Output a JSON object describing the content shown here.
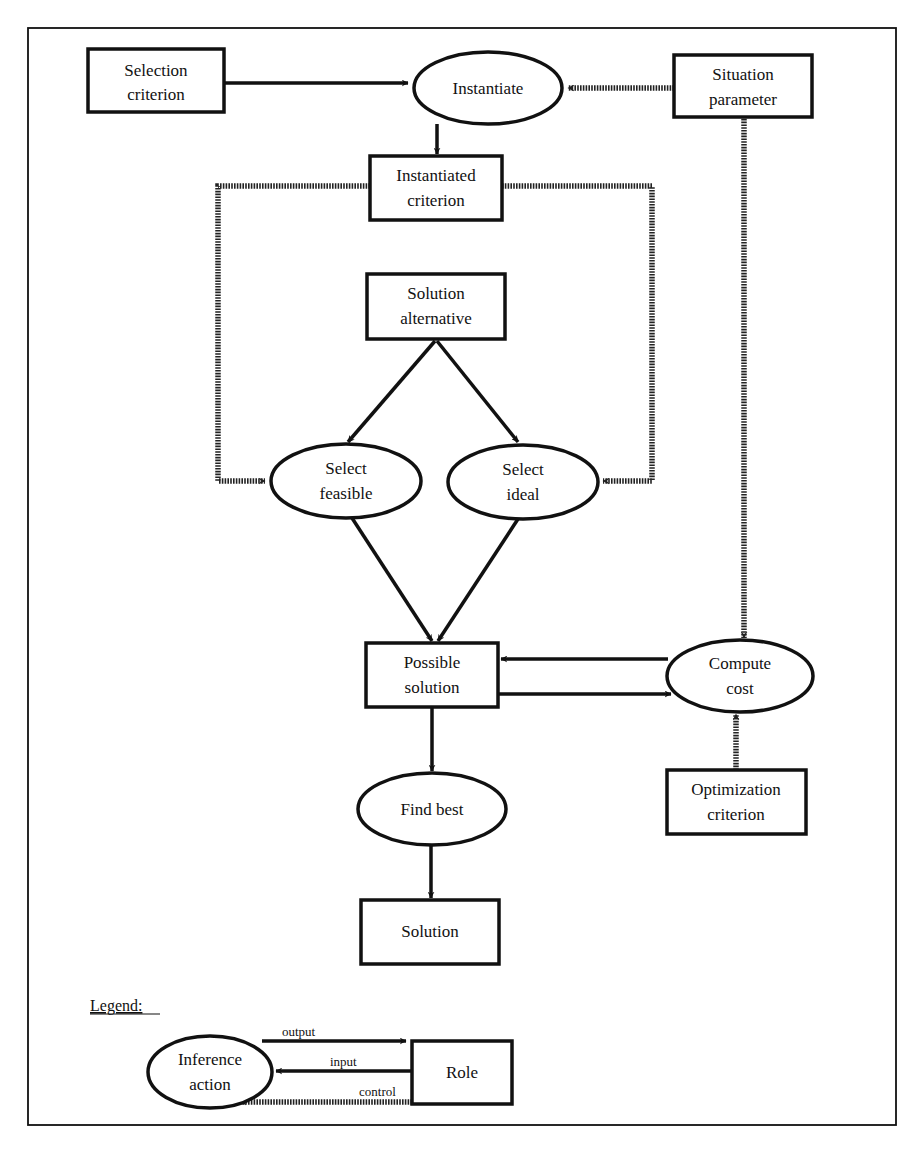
{
  "diagram": {
    "type": "inference-structure",
    "roles": {
      "selection_criterion": "Selection criterion",
      "situation_parameter": "Situation parameter",
      "instantiated_criterion": "Instantiated criterion",
      "solution_alternative": "Solution alternative",
      "possible_solution": "Possible solution",
      "optimization_criterion": "Optimization criterion",
      "solution": "Solution"
    },
    "role_lines": {
      "selection_criterion": [
        "Selection",
        "criterion"
      ],
      "situation_parameter": [
        "Situation",
        "parameter"
      ],
      "instantiated_criterion": [
        "Instantiated",
        "criterion"
      ],
      "solution_alternative": [
        "Solution",
        "alternative"
      ],
      "possible_solution": [
        "Possible",
        "solution"
      ],
      "optimization_criterion": [
        "Optimization",
        "criterion"
      ],
      "solution": [
        "Solution"
      ]
    },
    "inference_actions": {
      "instantiate": [
        "Instantiate"
      ],
      "select_feasible": [
        "Select",
        "feasible"
      ],
      "select_ideal": [
        "Select",
        "ideal"
      ],
      "compute_cost": [
        "Compute",
        "cost"
      ],
      "find_best": [
        "Find best"
      ]
    },
    "edges": [
      {
        "from": "Selection criterion",
        "to": "Instantiate",
        "kind": "input"
      },
      {
        "from": "Situation parameter",
        "to": "Instantiate",
        "kind": "control"
      },
      {
        "from": "Instantiate",
        "to": "Instantiated criterion",
        "kind": "output"
      },
      {
        "from": "Instantiated criterion",
        "to": "Select feasible",
        "kind": "control"
      },
      {
        "from": "Instantiated criterion",
        "to": "Select ideal",
        "kind": "control"
      },
      {
        "from": "Solution alternative",
        "to": "Select feasible",
        "kind": "input"
      },
      {
        "from": "Solution alternative",
        "to": "Select ideal",
        "kind": "input"
      },
      {
        "from": "Select feasible",
        "to": "Possible solution",
        "kind": "output"
      },
      {
        "from": "Select ideal",
        "to": "Possible solution",
        "kind": "output"
      },
      {
        "from": "Situation parameter",
        "to": "Compute cost",
        "kind": "control"
      },
      {
        "from": "Compute cost",
        "to": "Possible solution",
        "kind": "output"
      },
      {
        "from": "Possible solution",
        "to": "Compute cost",
        "kind": "input"
      },
      {
        "from": "Optimization criterion",
        "to": "Compute cost",
        "kind": "control"
      },
      {
        "from": "Possible solution",
        "to": "Find best",
        "kind": "input"
      },
      {
        "from": "Find best",
        "to": "Solution",
        "kind": "output"
      }
    ]
  },
  "legend": {
    "title": "Legend:",
    "inference_action": [
      "Inference",
      "action"
    ],
    "role": "Role",
    "output_label": "output",
    "input_label": "input",
    "control_label": "control"
  },
  "colors": {
    "stroke": "#111111",
    "background": "#ffffff"
  }
}
